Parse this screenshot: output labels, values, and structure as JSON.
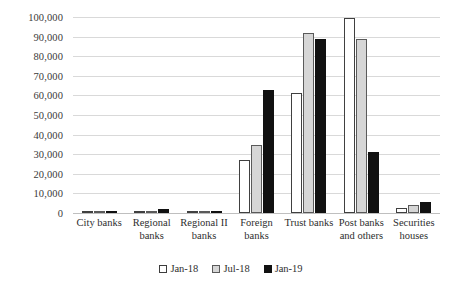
{
  "chart_data": {
    "type": "bar",
    "title": "",
    "xlabel": "",
    "ylabel": "",
    "ylim": [
      0,
      100000
    ],
    "grid": true,
    "legend_position": "bottom",
    "categories": [
      "City banks",
      "Regional banks",
      "Regional II banks",
      "Foreign banks",
      "Trust banks",
      "Post banks and others",
      "Securities houses"
    ],
    "category_lines": [
      [
        "City banks"
      ],
      [
        "Regional",
        "banks"
      ],
      [
        "Regional II",
        "banks"
      ],
      [
        "Foreign",
        "banks"
      ],
      [
        "Trust banks"
      ],
      [
        "Post banks",
        "and others"
      ],
      [
        "Securities",
        "houses"
      ]
    ],
    "ytick_labels": [
      "100,000",
      "90,000",
      "80,000",
      "70,000",
      "60,000",
      "50,000",
      "40,000",
      "30,000",
      "20,000",
      "10,000",
      "0"
    ],
    "ytick_values": [
      100000,
      90000,
      80000,
      70000,
      60000,
      50000,
      40000,
      30000,
      20000,
      10000,
      0
    ],
    "series": [
      {
        "name": "Jan-18",
        "color": "#ffffff",
        "edge_color": "#404040",
        "values": [
          200,
          900,
          600,
          27000,
          61000,
          99500,
          2500
        ]
      },
      {
        "name": "Jul-18",
        "color": "#d6d6d6",
        "edge_color": "#5a5a5a",
        "values": [
          250,
          1100,
          700,
          34500,
          92000,
          89000,
          4000
        ]
      },
      {
        "name": "Jan-19",
        "color": "#111111",
        "edge_color": "#111111",
        "values": [
          300,
          2100,
          800,
          63000,
          89000,
          31000,
          5500
        ]
      }
    ]
  }
}
